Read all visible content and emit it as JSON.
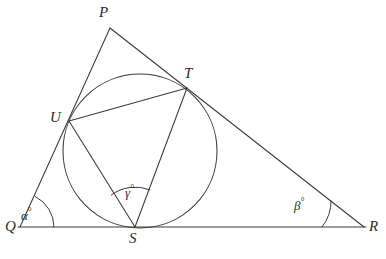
{
  "figure": {
    "canvas": {
      "width": 386,
      "height": 259
    },
    "background_color": "#ffffff",
    "stroke_color": "#3a3a3a",
    "label_color": "#2b2b2b"
  },
  "points": {
    "P": {
      "label": "P",
      "x": 110,
      "y": 28,
      "label_x": 99,
      "label_y": 5
    },
    "Q": {
      "label": "Q",
      "x": 20,
      "y": 227,
      "label_x": 5,
      "label_y": 219
    },
    "R": {
      "label": "R",
      "x": 364,
      "y": 227,
      "label_x": 369,
      "label_y": 219
    },
    "S": {
      "label": "S",
      "x": 135,
      "y": 227,
      "label_x": 129,
      "label_y": 231
    },
    "T": {
      "label": "T",
      "x": 187,
      "y": 88,
      "label_x": 184,
      "label_y": 66
    },
    "U": {
      "label": "U",
      "x": 69,
      "y": 121,
      "label_x": 50,
      "label_y": 110
    }
  },
  "circle": {
    "name": "incircle",
    "center_x": 140,
    "center_y": 151,
    "radius": 77
  },
  "segments": [
    {
      "name": "side-PQ",
      "from": "P",
      "to": "Q"
    },
    {
      "name": "side-PR",
      "from": "P",
      "to": "R"
    },
    {
      "name": "side-QR",
      "from": "Q",
      "to": "R"
    },
    {
      "name": "chord-UT",
      "from": "U",
      "to": "T"
    },
    {
      "name": "chord-US",
      "from": "U",
      "to": "S"
    },
    {
      "name": "chord-ST",
      "from": "S",
      "to": "T"
    }
  ],
  "angles": [
    {
      "name": "angle-alpha-at-Q",
      "symbol": "α",
      "degree_mark": "°",
      "vertex": "Q",
      "label_x": 21,
      "label_y": 207,
      "arc_radius": 34
    },
    {
      "name": "angle-beta-at-R",
      "symbol": "β",
      "degree_mark": "°",
      "vertex": "R",
      "label_x": 294,
      "label_y": 197,
      "arc_radius": 42
    },
    {
      "name": "angle-gamma-at-S",
      "symbol": "γ",
      "degree_mark": "°",
      "vertex": "S",
      "label_x": 125,
      "label_y": 184,
      "arc_radius": 40
    }
  ]
}
